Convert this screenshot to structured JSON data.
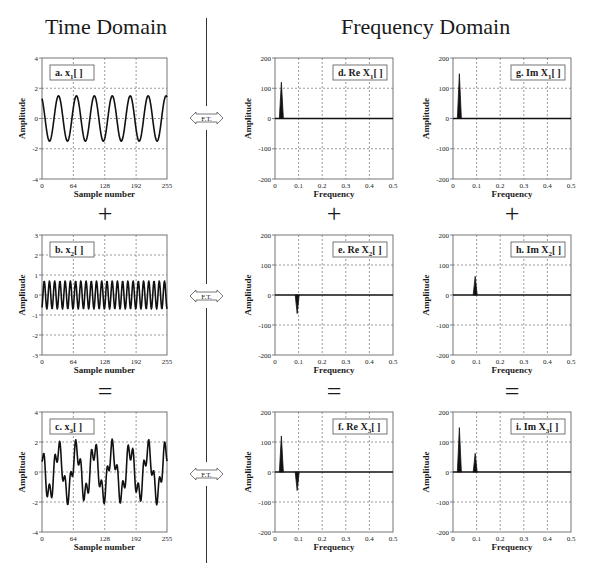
{
  "headings": {
    "time_domain": "Time Domain",
    "frequency_domain": "Frequency Domain"
  },
  "transform_label": "F.T.",
  "operators": {
    "plus": "+",
    "equals": "="
  },
  "colors": {
    "line": "#111111",
    "grid": "#555555",
    "frame": "#666666",
    "text": "#1a1a1a"
  },
  "chart_data": [
    {
      "id": "a",
      "type": "line",
      "title": "a.",
      "signal": "x",
      "sub": "1",
      "domain": "time",
      "label": "a. x1[ ]",
      "xlabel": "Sample number",
      "ylabel": "Amplitude",
      "xlim": [
        0,
        255
      ],
      "ylim": [
        -4,
        4
      ],
      "xticks": [
        0,
        64,
        128,
        192,
        255
      ],
      "yticks": [
        -4,
        -2,
        0,
        2,
        4
      ],
      "grid": true,
      "components": [
        {
          "amplitude": 1.5,
          "cycles": 7,
          "phase": 0.5
        }
      ]
    },
    {
      "id": "b",
      "type": "line",
      "title": "b.",
      "signal": "x",
      "sub": "2",
      "domain": "time",
      "label": "b. x2[ ]",
      "xlabel": "Sample number",
      "ylabel": "Amplitude",
      "xlim": [
        0,
        255
      ],
      "ylim": [
        -3,
        3
      ],
      "xticks": [
        0,
        64,
        128,
        192,
        255
      ],
      "yticks": [
        -3,
        -2,
        -1,
        0,
        1,
        2,
        3
      ],
      "grid": true,
      "components": [
        {
          "amplitude": 0.7,
          "cycles": 24,
          "phase": 3.6
        }
      ]
    },
    {
      "id": "c",
      "type": "line",
      "title": "c.",
      "signal": "x",
      "sub": "3",
      "domain": "time",
      "label": "c. x3[ ]",
      "xlabel": "Sample number",
      "ylabel": "Amplitude",
      "xlim": [
        0,
        255
      ],
      "ylim": [
        -4,
        4
      ],
      "xticks": [
        0,
        64,
        128,
        192,
        255
      ],
      "yticks": [
        -4,
        -2,
        0,
        2,
        4
      ],
      "grid": true,
      "components": [
        {
          "amplitude": 1.5,
          "cycles": 7,
          "phase": 0.5
        },
        {
          "amplitude": 0.7,
          "cycles": 24,
          "phase": 3.6
        }
      ]
    },
    {
      "id": "d",
      "type": "bar",
      "title": "d.",
      "signal": "Re X",
      "sub": "1",
      "domain": "frequency",
      "label": "d. Re X1[ ]",
      "xlabel": "Frequency",
      "ylabel": "Amplitude",
      "xlim": [
        0,
        0.5
      ],
      "ylim": [
        -200,
        200
      ],
      "xticks": [
        0,
        0.1,
        0.2,
        0.3,
        0.4,
        0.5
      ],
      "yticks": [
        -200,
        -100,
        0,
        100,
        200
      ],
      "grid": true,
      "peaks": [
        {
          "x": 0.027,
          "y": 120
        }
      ]
    },
    {
      "id": "e",
      "type": "bar",
      "title": "e.",
      "signal": "Re X",
      "sub": "2",
      "domain": "frequency",
      "label": "e. Re X2[ ]",
      "xlabel": "Frequency",
      "ylabel": "Amplitude",
      "xlim": [
        0,
        0.5
      ],
      "ylim": [
        -200,
        200
      ],
      "xticks": [
        0,
        0.1,
        0.2,
        0.3,
        0.4,
        0.5
      ],
      "yticks": [
        -200,
        -100,
        0,
        100,
        200
      ],
      "grid": true,
      "peaks": [
        {
          "x": 0.094,
          "y": -62
        }
      ]
    },
    {
      "id": "f",
      "type": "bar",
      "title": "f.",
      "signal": "Re X",
      "sub": "3",
      "domain": "frequency",
      "label": "f. Re X3[ ]",
      "xlabel": "Frequency",
      "ylabel": "Amplitude",
      "xlim": [
        0,
        0.5
      ],
      "ylim": [
        -200,
        200
      ],
      "xticks": [
        0,
        0.1,
        0.2,
        0.3,
        0.4,
        0.5
      ],
      "yticks": [
        -200,
        -100,
        0,
        100,
        200
      ],
      "grid": true,
      "peaks": [
        {
          "x": 0.027,
          "y": 120
        },
        {
          "x": 0.094,
          "y": -62
        }
      ]
    },
    {
      "id": "g",
      "type": "bar",
      "title": "g.",
      "signal": "Im X",
      "sub": "1",
      "domain": "frequency",
      "label": "g. Im X1[ ]",
      "xlabel": "Frequency",
      "ylabel": "Amplitude",
      "xlim": [
        0,
        0.5
      ],
      "ylim": [
        -200,
        200
      ],
      "xticks": [
        0,
        0.1,
        0.2,
        0.3,
        0.4,
        0.5
      ],
      "yticks": [
        -200,
        -100,
        0,
        100,
        200
      ],
      "grid": true,
      "peaks": [
        {
          "x": 0.027,
          "y": 148
        }
      ]
    },
    {
      "id": "h",
      "type": "bar",
      "title": "h.",
      "signal": "Im X",
      "sub": "2",
      "domain": "frequency",
      "label": "h. Im X2[ ]",
      "xlabel": "Frequency",
      "ylabel": "Amplitude",
      "xlim": [
        0,
        0.5
      ],
      "ylim": [
        -200,
        200
      ],
      "xticks": [
        0,
        0.1,
        0.2,
        0.3,
        0.4,
        0.5
      ],
      "yticks": [
        -200,
        -100,
        0,
        100,
        200
      ],
      "grid": true,
      "peaks": [
        {
          "x": 0.094,
          "y": 62
        }
      ]
    },
    {
      "id": "i",
      "type": "bar",
      "title": "i.",
      "signal": "Im X",
      "sub": "3",
      "domain": "frequency",
      "label": "i. Im X3[ ]",
      "xlabel": "Frequency",
      "ylabel": "Amplitude",
      "xlim": [
        0,
        0.5
      ],
      "ylim": [
        -200,
        200
      ],
      "xticks": [
        0,
        0.1,
        0.2,
        0.3,
        0.4,
        0.5
      ],
      "yticks": [
        -200,
        -100,
        0,
        100,
        200
      ],
      "grid": true,
      "peaks": [
        {
          "x": 0.027,
          "y": 148
        },
        {
          "x": 0.094,
          "y": 62
        }
      ]
    }
  ]
}
